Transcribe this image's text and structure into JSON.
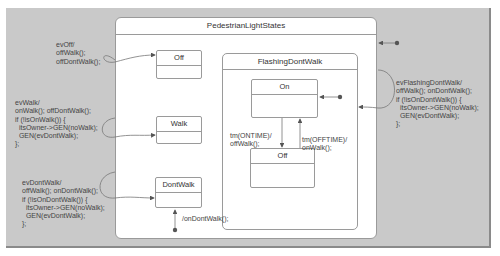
{
  "diagram": {
    "title": "PedestrianLightStates",
    "states": [
      {
        "id": "off",
        "name": "Off"
      },
      {
        "id": "walk",
        "name": "Walk"
      },
      {
        "id": "dontwalk",
        "name": "DontWalk"
      }
    ],
    "composite": {
      "name": "FlashingDontWalk",
      "states": [
        {
          "id": "on",
          "name": "On"
        },
        {
          "id": "off2",
          "name": "Off"
        }
      ]
    },
    "transitions": {
      "evOff": "evOff/\noffWalk();\noffDontWalk();",
      "evWalk": "evWalk/\nonWalk(); offDontWalk();\nif (!isOnWalk()) {\n  itsOwner->GEN(noWalk);\n  GEN(evDontWalk);\n};",
      "evDontWalk": "evDontWalk/\noffWalk(); onDontWalk();\nif (!isOnDontWalk()) {\n  itsOwner->GEN(noWalk);\n  GEN(evDontWalk);\n};",
      "evFlashingDontWalk": "evFlashingDontWalk/\noffWalk(); onDontWalk();\nif (!isOnDontWalk()) {\n  itsOwner->GEN(noWalk);\n  GEN(evDontWalk);\n};",
      "onTime": "tm(ONTIME)/\noffWalk();",
      "offTime": "tm(OFFTIME)/\nonWalk();",
      "initial": "/onDontWalk();"
    }
  }
}
